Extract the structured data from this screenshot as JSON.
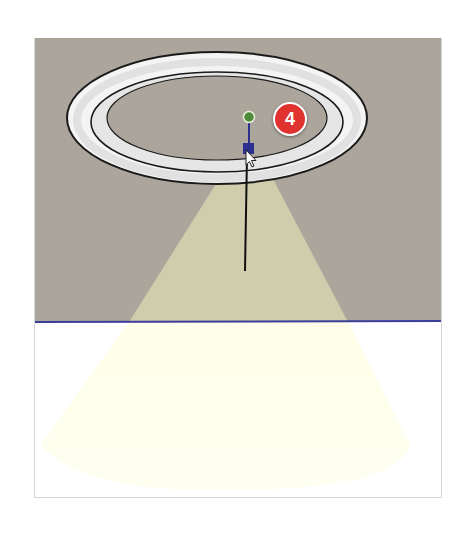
{
  "scene": {
    "description": "3D modeling viewport showing a recessed ceiling light with spotlight cone",
    "colors": {
      "ceiling": "#aca59b",
      "floor": "#ffffff",
      "light_cone": "#f6f6cf",
      "light_cone_on_floor": "#fffff0",
      "horizon_line": "#3b3f9a",
      "ring_outline": "#1a1a1a",
      "ring_fill": "#f2f2f2",
      "light_point": "#4f8a3a",
      "light_target_handle": "#2b2f8f"
    }
  },
  "callout": {
    "step_number": "4",
    "color": "#e0322f"
  },
  "cursor": {
    "icon": "arrow-pointer-icon"
  }
}
